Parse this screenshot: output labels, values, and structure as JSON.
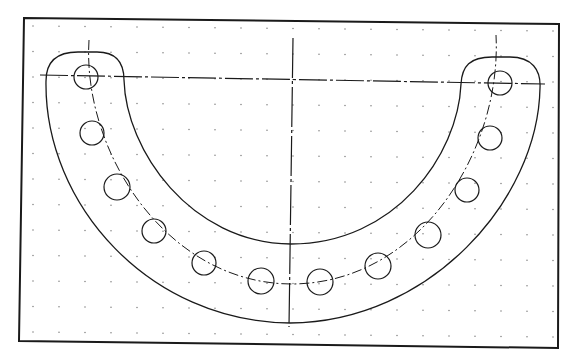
{
  "drawing": {
    "title": "Semicircular flange with bolt circle",
    "colors": {
      "line": "#1a1a1a",
      "grid": "#8a8a8a",
      "background": "#ffffff"
    },
    "frame": {
      "tl": [
        24,
        18
      ],
      "tr": [
        559,
        24
      ],
      "br": [
        558,
        348
      ],
      "bl": [
        19,
        341
      ]
    },
    "grid": {
      "x0": 33,
      "y0": 26,
      "dx": 26,
      "dy": 25.5,
      "cols": 21,
      "rows": 13
    },
    "centerlines": {
      "horizontal": {
        "x1": 40,
        "y1": 75,
        "x2": 545,
        "y2": 84
      },
      "vertical": {
        "x1": 293,
        "y1": 38,
        "x2": 289,
        "y2": 327
      }
    },
    "holes": [
      {
        "cx": 86,
        "cy": 77,
        "r": 12
      },
      {
        "cx": 92,
        "cy": 133,
        "r": 12
      },
      {
        "cx": 117,
        "cy": 187,
        "r": 13
      },
      {
        "cx": 154,
        "cy": 231,
        "r": 12
      },
      {
        "cx": 204,
        "cy": 263,
        "r": 12
      },
      {
        "cx": 261,
        "cy": 281,
        "r": 13
      },
      {
        "cx": 320,
        "cy": 282,
        "r": 13
      },
      {
        "cx": 378,
        "cy": 266,
        "r": 13
      },
      {
        "cx": 428,
        "cy": 235,
        "r": 13
      },
      {
        "cx": 467,
        "cy": 190,
        "r": 12
      },
      {
        "cx": 490,
        "cy": 138,
        "r": 12
      },
      {
        "cx": 500,
        "cy": 83,
        "r": 12
      }
    ]
  }
}
